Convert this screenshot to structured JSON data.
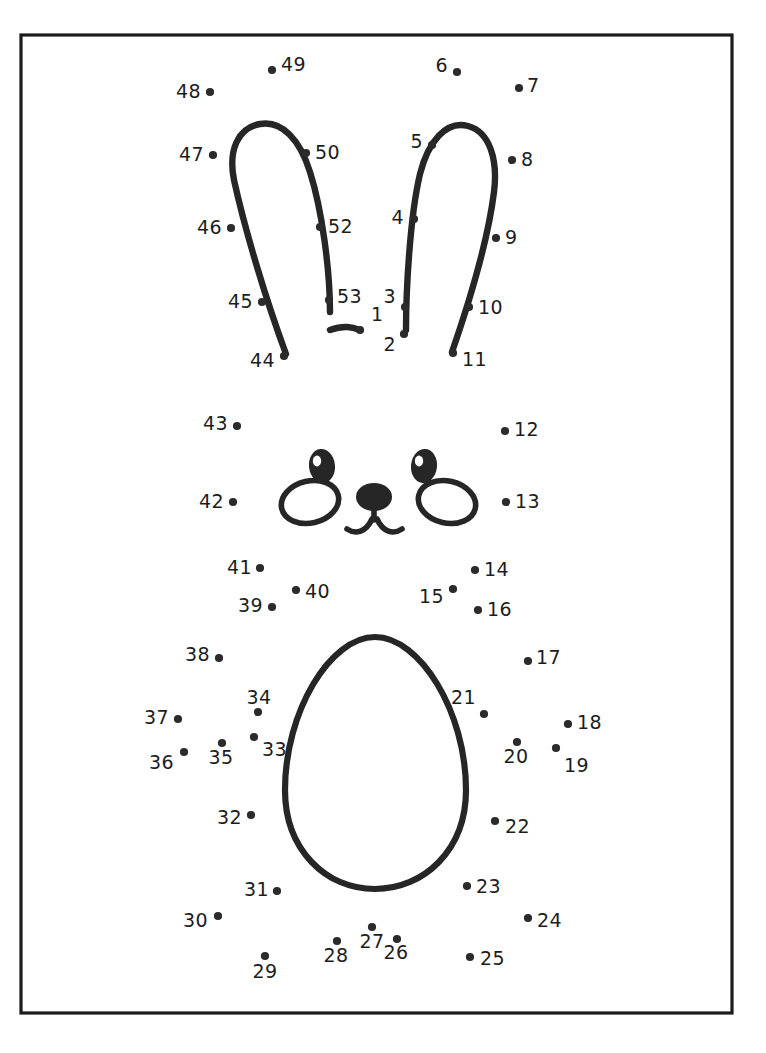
{
  "page": {
    "width": 766,
    "height": 1053,
    "background_color": "#ffffff",
    "ink_color": "#262626",
    "dot_color": "#2b2b2b",
    "label_color": "#1d1d1d"
  },
  "frame": {
    "x": 21,
    "y": 35,
    "width": 711,
    "height": 978,
    "stroke_color": "#1b1b1b"
  },
  "artwork": {
    "title": "bunny-face-and-egg-dot-to-dot",
    "left_ear": "outlined tall bunny ear leaning left, apex near top",
    "right_ear": "outlined tall bunny ear leaning right, apex near top",
    "bridge": "short curved stroke between the two ear bases",
    "face": {
      "left_eye": "filled oval with white highlight",
      "right_eye": "filled oval with white highlight",
      "left_cheek": "outlined tilted oval",
      "right_cheek": "outlined tilted oval",
      "nose": "filled rounded nose with stem and two curved whisker strokes"
    },
    "egg": "large outlined egg shape forming the body"
  },
  "dots": [
    {
      "n": "1",
      "cx": 360,
      "cy": 330,
      "lx": 371,
      "ly": 315,
      "anchor": "start"
    },
    {
      "n": "2",
      "cx": 404,
      "cy": 334,
      "lx": 396,
      "ly": 345,
      "anchor": "end"
    },
    {
      "n": "3",
      "cx": 405,
      "cy": 307,
      "lx": 396,
      "ly": 297,
      "anchor": "end"
    },
    {
      "n": "4",
      "cx": 414,
      "cy": 219,
      "lx": 404,
      "ly": 218,
      "anchor": "end"
    },
    {
      "n": "5",
      "cx": 432,
      "cy": 145,
      "lx": 423,
      "ly": 142,
      "anchor": "end"
    },
    {
      "n": "6",
      "cx": 457,
      "cy": 72,
      "lx": 448,
      "ly": 66,
      "anchor": "end"
    },
    {
      "n": "7",
      "cx": 519,
      "cy": 88,
      "lx": 527,
      "ly": 86,
      "anchor": "start"
    },
    {
      "n": "8",
      "cx": 512,
      "cy": 160,
      "lx": 521,
      "ly": 160,
      "anchor": "start"
    },
    {
      "n": "9",
      "cx": 496,
      "cy": 238,
      "lx": 505,
      "ly": 238,
      "anchor": "start"
    },
    {
      "n": "10",
      "cx": 469,
      "cy": 307,
      "lx": 478,
      "ly": 308,
      "anchor": "start"
    },
    {
      "n": "11",
      "cx": 453,
      "cy": 353,
      "lx": 462,
      "ly": 360,
      "anchor": "start"
    },
    {
      "n": "12",
      "cx": 505,
      "cy": 431,
      "lx": 514,
      "ly": 430,
      "anchor": "start"
    },
    {
      "n": "13",
      "cx": 506,
      "cy": 502,
      "lx": 515,
      "ly": 502,
      "anchor": "start"
    },
    {
      "n": "14",
      "cx": 475,
      "cy": 570,
      "lx": 484,
      "ly": 570,
      "anchor": "start"
    },
    {
      "n": "15",
      "cx": 453,
      "cy": 589,
      "lx": 444,
      "ly": 597,
      "anchor": "end"
    },
    {
      "n": "16",
      "cx": 478,
      "cy": 610,
      "lx": 487,
      "ly": 610,
      "anchor": "start"
    },
    {
      "n": "17",
      "cx": 528,
      "cy": 661,
      "lx": 536,
      "ly": 658,
      "anchor": "start"
    },
    {
      "n": "18",
      "cx": 568,
      "cy": 724,
      "lx": 577,
      "ly": 723,
      "anchor": "start"
    },
    {
      "n": "19",
      "cx": 556,
      "cy": 748,
      "lx": 564,
      "ly": 766,
      "anchor": "start"
    },
    {
      "n": "20",
      "cx": 517,
      "cy": 742,
      "lx": 516,
      "ly": 757,
      "anchor": "middle"
    },
    {
      "n": "21",
      "cx": 484,
      "cy": 714,
      "lx": 476,
      "ly": 698,
      "anchor": "end"
    },
    {
      "n": "22",
      "cx": 495,
      "cy": 821,
      "lx": 505,
      "ly": 827,
      "anchor": "start"
    },
    {
      "n": "23",
      "cx": 467,
      "cy": 886,
      "lx": 476,
      "ly": 887,
      "anchor": "start"
    },
    {
      "n": "24",
      "cx": 528,
      "cy": 918,
      "lx": 537,
      "ly": 921,
      "anchor": "start"
    },
    {
      "n": "25",
      "cx": 470,
      "cy": 957,
      "lx": 480,
      "ly": 959,
      "anchor": "start"
    },
    {
      "n": "26",
      "cx": 397,
      "cy": 939,
      "lx": 396,
      "ly": 953,
      "anchor": "middle"
    },
    {
      "n": "27",
      "cx": 372,
      "cy": 927,
      "lx": 372,
      "ly": 942,
      "anchor": "middle"
    },
    {
      "n": "28",
      "cx": 337,
      "cy": 941,
      "lx": 336,
      "ly": 956,
      "anchor": "middle"
    },
    {
      "n": "29",
      "cx": 265,
      "cy": 956,
      "lx": 265,
      "ly": 972,
      "anchor": "middle"
    },
    {
      "n": "30",
      "cx": 218,
      "cy": 916,
      "lx": 208,
      "ly": 921,
      "anchor": "end"
    },
    {
      "n": "31",
      "cx": 277,
      "cy": 891,
      "lx": 269,
      "ly": 890,
      "anchor": "end"
    },
    {
      "n": "32",
      "cx": 251,
      "cy": 815,
      "lx": 242,
      "ly": 818,
      "anchor": "end"
    },
    {
      "n": "33",
      "cx": 254,
      "cy": 737,
      "lx": 262,
      "ly": 750,
      "anchor": "start"
    },
    {
      "n": "34",
      "cx": 258,
      "cy": 712,
      "lx": 259,
      "ly": 698,
      "anchor": "middle"
    },
    {
      "n": "35",
      "cx": 222,
      "cy": 743,
      "lx": 221,
      "ly": 758,
      "anchor": "middle"
    },
    {
      "n": "36",
      "cx": 184,
      "cy": 752,
      "lx": 174,
      "ly": 763,
      "anchor": "end"
    },
    {
      "n": "37",
      "cx": 178,
      "cy": 719,
      "lx": 169,
      "ly": 718,
      "anchor": "end"
    },
    {
      "n": "38",
      "cx": 219,
      "cy": 658,
      "lx": 210,
      "ly": 655,
      "anchor": "end"
    },
    {
      "n": "39",
      "cx": 272,
      "cy": 607,
      "lx": 263,
      "ly": 606,
      "anchor": "end"
    },
    {
      "n": "40",
      "cx": 296,
      "cy": 590,
      "lx": 305,
      "ly": 592,
      "anchor": "start"
    },
    {
      "n": "41",
      "cx": 260,
      "cy": 568,
      "lx": 252,
      "ly": 568,
      "anchor": "end"
    },
    {
      "n": "42",
      "cx": 233,
      "cy": 502,
      "lx": 224,
      "ly": 502,
      "anchor": "end"
    },
    {
      "n": "43",
      "cx": 237,
      "cy": 426,
      "lx": 228,
      "ly": 424,
      "anchor": "end"
    },
    {
      "n": "44",
      "cx": 284,
      "cy": 356,
      "lx": 275,
      "ly": 361,
      "anchor": "end"
    },
    {
      "n": "45",
      "cx": 262,
      "cy": 302,
      "lx": 253,
      "ly": 302,
      "anchor": "end"
    },
    {
      "n": "46",
      "cx": 231,
      "cy": 228,
      "lx": 222,
      "ly": 228,
      "anchor": "end"
    },
    {
      "n": "47",
      "cx": 213,
      "cy": 155,
      "lx": 204,
      "ly": 155,
      "anchor": "end"
    },
    {
      "n": "48",
      "cx": 210,
      "cy": 92,
      "lx": 201,
      "ly": 92,
      "anchor": "end"
    },
    {
      "n": "49",
      "cx": 272,
      "cy": 70,
      "lx": 281,
      "ly": 65,
      "anchor": "start"
    },
    {
      "n": "50",
      "cx": 306,
      "cy": 153,
      "lx": 315,
      "ly": 153,
      "anchor": "start"
    },
    {
      "n": "52",
      "cx": 320,
      "cy": 227,
      "lx": 328,
      "ly": 227,
      "anchor": "start"
    },
    {
      "n": "53",
      "cx": 329,
      "cy": 300,
      "lx": 337,
      "ly": 297,
      "anchor": "start"
    }
  ],
  "dot_count": 52,
  "number_range": {
    "first": "1",
    "last": "53"
  }
}
